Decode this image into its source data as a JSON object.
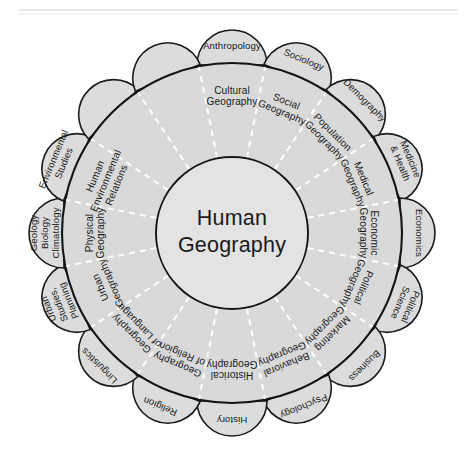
{
  "diagram": {
    "center": {
      "lines": [
        "Human",
        "Geography"
      ]
    },
    "segments": [
      {
        "index": 0,
        "angle_deg": -90,
        "inner_label": "Cultural Geography",
        "inner_lines": [
          "Cultural",
          "Geography"
        ],
        "outer_label": "Anthropology",
        "outer_lines": [
          "Anthropology"
        ]
      },
      {
        "index": 1,
        "angle_deg": -67.5,
        "inner_label": "Social Geography",
        "inner_lines": [
          "Social",
          "Geography"
        ],
        "outer_label": "Sociology",
        "outer_lines": [
          "Sociology"
        ]
      },
      {
        "index": 2,
        "angle_deg": -45,
        "inner_label": "Population Geography",
        "inner_lines": [
          "Population",
          "Geography"
        ],
        "outer_label": "Demography",
        "outer_lines": [
          "Demography"
        ]
      },
      {
        "index": 3,
        "angle_deg": -22.5,
        "inner_label": "Medical Geography",
        "inner_lines": [
          "Medical",
          "Geography"
        ],
        "outer_label": "Medicine & Health",
        "outer_lines": [
          "Medicine",
          "& Health"
        ]
      },
      {
        "index": 4,
        "angle_deg": 0,
        "inner_label": "Economic Geography",
        "inner_lines": [
          "Economic",
          "Geography"
        ],
        "outer_label": "Economics",
        "outer_lines": [
          "Economics"
        ]
      },
      {
        "index": 5,
        "angle_deg": 22.5,
        "inner_label": "Political Geography",
        "inner_lines": [
          "Political",
          "Geography"
        ],
        "outer_label": "Political Science",
        "outer_lines": [
          "Political",
          "Science"
        ]
      },
      {
        "index": 6,
        "angle_deg": 45,
        "inner_label": "Marketing Geography",
        "inner_lines": [
          "Marketing",
          "Geography"
        ],
        "outer_label": "Business",
        "outer_lines": [
          "Business"
        ]
      },
      {
        "index": 7,
        "angle_deg": 67.5,
        "inner_label": "Behavioral Geography",
        "inner_lines": [
          "Behavioral",
          "Geography"
        ],
        "outer_label": "Psychology",
        "outer_lines": [
          "Psychology"
        ]
      },
      {
        "index": 8,
        "angle_deg": 90,
        "inner_label": "Historical Geography",
        "inner_lines": [
          "Historical",
          "Geography"
        ],
        "outer_label": "History",
        "outer_lines": [
          "History"
        ]
      },
      {
        "index": 9,
        "angle_deg": 112.5,
        "inner_label": "Geography of Religion",
        "inner_lines": [
          "Geography",
          "of Religion"
        ],
        "outer_label": "Religion",
        "outer_lines": [
          "Religion"
        ]
      },
      {
        "index": 10,
        "angle_deg": 135,
        "inner_label": "Geography of Language",
        "inner_lines": [
          "Geography",
          "of Language"
        ],
        "outer_label": "Linguistics",
        "outer_lines": [
          "Linguistics"
        ]
      },
      {
        "index": 11,
        "angle_deg": 157.5,
        "inner_label": "Urban Geography",
        "inner_lines": [
          "Urban",
          "Geography"
        ],
        "outer_label": "Urban Studies, Planning",
        "outer_lines": [
          "Urban",
          "Studies,",
          "Planning"
        ]
      },
      {
        "index": 12,
        "angle_deg": 180,
        "inner_label": "Physical Geography",
        "inner_lines": [
          "Physical",
          "Geography"
        ],
        "outer_label": "Geology Biology Climatology",
        "outer_lines": [
          "Geology",
          "Biology",
          "Climatology"
        ]
      },
      {
        "index": 13,
        "angle_deg": -157.5,
        "inner_label": "Human Environmental Relations",
        "inner_lines": [
          "Human",
          "Environmental",
          "Relations"
        ],
        "outer_label": "Environmental Studies",
        "outer_lines": [
          "Environmental",
          "Studies"
        ]
      },
      {
        "index": 14,
        "angle_deg": -135,
        "inner_label": "",
        "inner_lines": [],
        "outer_label": "",
        "outer_lines": []
      },
      {
        "index": 15,
        "angle_deg": -112.5,
        "inner_label": "",
        "inner_lines": [],
        "outer_label": "",
        "outer_lines": []
      }
    ],
    "colors": {
      "petal_fill": "#dcdcdc",
      "ring_fill": "#d9d9d9",
      "inner_fill": "#e3e3e3",
      "stroke": "#141414",
      "divider": "#ffffff",
      "text": "#1a1a1a",
      "background": "#ffffff"
    },
    "geometry": {
      "center_x": 232,
      "center_y": 233,
      "inner_radius": 76,
      "outer_radius": 170,
      "petal_radius": 35,
      "petal_count": 16
    }
  }
}
